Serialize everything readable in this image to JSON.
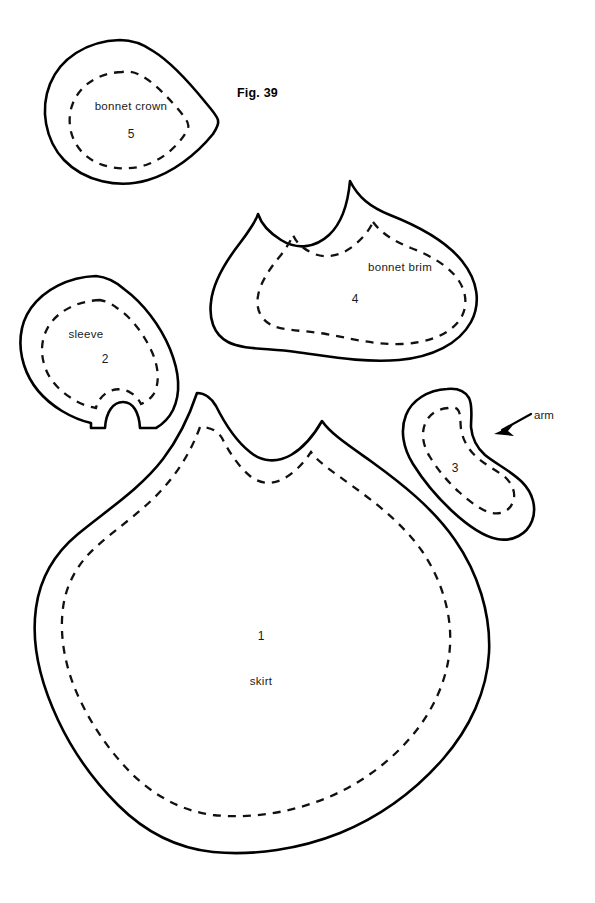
{
  "page": {
    "background_color": "#ffffff",
    "ink_color": "#000000",
    "figure_caption": "Fig. 39",
    "figure_caption_pos": {
      "x": 237,
      "y": 97
    }
  },
  "pieces": [
    {
      "id": "bonnet-crown",
      "label": "bonnet crown",
      "number": "5",
      "label_pos": {
        "x": 131,
        "y": 110
      },
      "number_pos": {
        "x": 131,
        "y": 138
      },
      "cut_path": "M 120 40 C 86 41 60 59 50 84 C 40 109 45 140 64 160 C 84 181 118 189 148 180 C 172 173 196 155 213 134 C 217 128 219 124 218 120 C 217 116 212 110 206 103 C 189 82 171 62 153 51 C 143 44 132 40 120 40 Z",
      "stitch_path": "M 122 72 C 97 73 80 86 73 103 C 66 120 70 141 84 154 C 99 168 124 172 146 165 C 161 160 176 148 185 134 C 188 130 189 127 188 124 C 187 120 183 115 178 109 C 165 94 152 81 140 75 C 134 72 128 71 122 72 Z"
    },
    {
      "id": "bonnet-brim",
      "label": "bonnet brim",
      "number": "4",
      "label_pos": {
        "x": 400,
        "y": 271
      },
      "number_pos": {
        "x": 355,
        "y": 303
      },
      "cut_path": "M 350 181 C 358 197 370 207 390 215 C 418 226 446 241 462 261 C 478 281 481 303 471 322 C 459 344 432 357 399 360 C 362 363 327 356 296 352 C 268 348 243 350 228 342 C 213 334 209 318 211 302 C 213 282 226 261 240 243 C 249 231 256 221 258 214 C 261 223 268 232 281 240 C 297 250 315 248 329 235 C 342 223 348 203 350 181 Z",
      "stitch_path": "M 373 222 C 382 234 394 241 411 248 C 432 256 450 267 459 281 C 468 295 467 310 459 321 C 448 335 427 343 402 344 C 374 345 349 338 326 334 C 303 330 283 331 271 325 C 259 318 256 307 258 296 C 260 283 270 268 281 255 C 287 247 291 240 293 235 C 296 242 302 248 312 253 C 325 259 340 256 352 247 C 362 239 369 231 373 222 Z"
    },
    {
      "id": "sleeve",
      "label": "sleeve",
      "number": "2",
      "label_pos": {
        "x": 86,
        "y": 338
      },
      "number_pos": {
        "x": 105,
        "y": 363
      },
      "cut_path": "M 96 276 C 68 277 44 290 31 308 C 19 325 18 346 24 365 C 30 384 44 400 62 411 C 72 417 82 421 91 423 L 91 428 L 105 428 C 106 412 113 402 123 402 C 133 402 139 412 140 428 L 156 428 C 163 424 169 418 173 410 C 181 393 179 371 170 349 C 160 325 143 303 124 289 C 115 281 106 277 96 276 Z",
      "stitch_path": "M 100 300 C 78 301 60 310 50 324 C 41 337 40 353 45 367 C 50 382 62 393 76 401 C 83 405 90 407 96 408 C 98 400 103 394 110 391 C 117 388 125 389 131 393 C 136 396 139 400 141 404 C 146 402 150 399 153 395 C 160 384 159 368 152 352 C 144 334 131 317 117 308 C 111 303 105 301 100 300 Z"
    },
    {
      "id": "arm",
      "label": "arm",
      "number": "3",
      "label_pos": {
        "x": 544,
        "y": 420
      },
      "number_pos": {
        "x": 455,
        "y": 472
      },
      "cut_path": "M 447 389 C 428 390 412 400 406 415 C 400 430 403 448 413 464 C 423 480 437 497 452 511 C 466 524 482 536 497 539 C 513 542 527 534 532 521 C 537 508 533 493 522 482 C 511 471 496 464 485 455 C 476 447 472 438 471 427 C 471 416 473 406 469 398 C 465 391 457 388 447 389 Z",
      "stitch_path": "M 448 408 C 437 409 428 415 425 424 C 421 434 423 446 430 457 C 437 469 448 482 459 492 C 470 502 482 511 492 513 C 502 515 510 510 513 502 C 516 494 513 485 506 478 C 498 471 487 466 479 459 C 469 451 463 441 461 429 C 460 421 461 414 458 410 C 456 407 452 407 448 408 Z"
    },
    {
      "id": "skirt",
      "label": "skirt",
      "number": "1",
      "label_pos": {
        "x": 261,
        "y": 685
      },
      "number_pos": {
        "x": 261,
        "y": 640
      },
      "cut_path": "M 197 393 C 190 414 179 438 163 459 C 140 489 107 510 78 534 C 55 553 40 578 36 608 C 31 644 41 684 58 720 C 73 752 94 781 118 805 C 143 830 175 848 213 852 C 254 856 300 849 340 833 C 379 817 415 791 443 759 C 470 728 487 691 489 653 C 491 614 478 573 455 540 C 433 508 401 483 372 462 C 348 445 331 434 322 421 C 314 435 303 448 291 455 C 277 463 262 462 250 452 C 236 441 224 422 216 406 C 212 399 205 393 197 393 Z",
      "stitch_path": "M 200 427 C 192 449 180 469 166 485 C 146 509 118 527 96 547 C 78 563 66 584 63 608 C 59 638 66 672 81 702 C 94 729 112 754 133 775 C 155 796 182 811 213 815 C 249 819 289 813 324 799 C 357 786 388 764 411 737 C 434 710 448 678 450 646 C 452 613 441 579 422 551 C 403 524 376 503 351 485 C 332 471 318 462 311 452 C 303 464 293 474 283 479 C 272 485 260 484 250 476 C 239 467 229 452 222 438 C 218 431 210 427 200 427 Z"
    }
  ],
  "callouts": [
    {
      "id": "arm-callout",
      "label": "arm",
      "arrow_from": {
        "x": 531,
        "y": 414
      },
      "arrow_to": {
        "x": 496,
        "y": 433
      }
    }
  ]
}
